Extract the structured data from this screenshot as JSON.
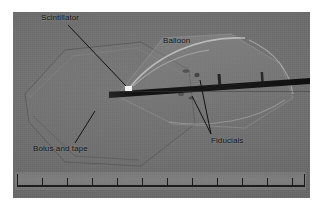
{
  "figure": {
    "type": "radiograph-photo",
    "page_background": "#ffffff",
    "photo": {
      "x": 13,
      "y": 12,
      "width": 297,
      "height": 186,
      "base_color": "#6f6f6f"
    }
  },
  "annotations": [
    {
      "id": "scintillator",
      "label": "Scintillator",
      "label_x": 41,
      "label_y": 14,
      "leader": {
        "x1": 66,
        "y1": 24,
        "x2": 124,
        "y2": 85
      },
      "color": "#101010"
    },
    {
      "id": "balloon",
      "label": "Balloon",
      "label_x": 163,
      "label_y": 37,
      "leader": null,
      "color": "#101010"
    },
    {
      "id": "bolus-and-tape",
      "label": "Bolus and tape",
      "label_x": 33,
      "label_y": 145,
      "leader": {
        "x1": 73,
        "y1": 142,
        "x2": 93,
        "y2": 110
      },
      "color": "#101010"
    },
    {
      "id": "fiducials",
      "label": "Fiducials",
      "label_x": 211,
      "label_y": 137,
      "leader": {
        "x1": 209,
        "y1": 134,
        "x2": 190,
        "y2": 95
      },
      "leader2": {
        "x1": 209,
        "y1": 134,
        "x2": 198,
        "y2": 79
      },
      "color": "#101010"
    }
  ],
  "features": {
    "catheter": {
      "name": "catheter-rod",
      "color": "#151515",
      "start_x": 108,
      "start_y": 89,
      "end_x": 297,
      "end_y": 78
    },
    "scintillator_marker": {
      "name": "scintillator-marker",
      "color": "#f2f2f2",
      "x": 125,
      "y": 86,
      "width": 7,
      "height": 5
    },
    "balloon_outline": {
      "name": "balloon-outline",
      "highlight_color": "#c9c9c9"
    },
    "bolus_outline": {
      "name": "bolus-outline",
      "edge_color": "#5a5a5a"
    },
    "fiducial_specks": [
      {
        "x": 186,
        "y": 71
      },
      {
        "x": 196,
        "y": 75
      },
      {
        "x": 180,
        "y": 93
      },
      {
        "x": 190,
        "y": 97
      }
    ]
  },
  "ruler": {
    "name": "measurement-ruler",
    "tick_count": 12,
    "tick_spacing_px": 25,
    "baseline_color": "#1d1d1d",
    "ticks": [
      {
        "pos": 2,
        "type": "major"
      },
      {
        "pos": 27,
        "type": "minor"
      },
      {
        "pos": 52,
        "type": "minor"
      },
      {
        "pos": 77,
        "type": "minor"
      },
      {
        "pos": 102,
        "type": "minor"
      },
      {
        "pos": 127,
        "type": "minor"
      },
      {
        "pos": 152,
        "type": "minor"
      },
      {
        "pos": 177,
        "type": "minor"
      },
      {
        "pos": 202,
        "type": "minor"
      },
      {
        "pos": 227,
        "type": "minor"
      },
      {
        "pos": 252,
        "type": "minor"
      },
      {
        "pos": 277,
        "type": "minor"
      },
      {
        "pos": 289,
        "type": "major"
      }
    ]
  }
}
